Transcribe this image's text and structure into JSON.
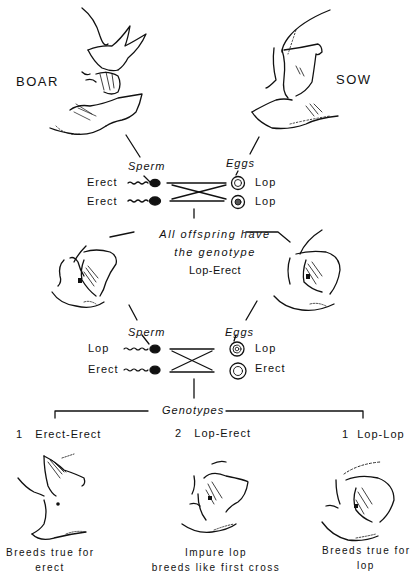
{
  "parents": {
    "boar_label": "BOAR",
    "sow_label": "SOW"
  },
  "cross1": {
    "sperm_heading": "Sperm",
    "eggs_heading": "Eggs",
    "sperm": [
      {
        "allele": "Erect"
      },
      {
        "allele": "Erect"
      }
    ],
    "eggs": [
      {
        "allele": "Lop"
      },
      {
        "allele": "Lop"
      }
    ],
    "result_line1": "All offspring have",
    "result_line2": "the genotype",
    "result_genotype": "Lop-Erect"
  },
  "cross2": {
    "sperm_heading": "Sperm",
    "eggs_heading": "Eggs",
    "sperm": [
      {
        "allele": "Lop"
      },
      {
        "allele": "Erect"
      }
    ],
    "eggs": [
      {
        "allele": "Lop"
      },
      {
        "allele": "Erect"
      }
    ],
    "genotypes_heading": "Genotypes"
  },
  "outcomes": [
    {
      "ratio": "1",
      "genotype": "Erect-Erect",
      "caption_line1": "Breeds true for",
      "caption_line2": "erect"
    },
    {
      "ratio": "2",
      "genotype": "Lop-Erect",
      "caption_line1": "Impure lop",
      "caption_line2": "breeds like first cross"
    },
    {
      "ratio": "1",
      "genotype": "Lop-Lop",
      "caption_line1": "Breeds true for",
      "caption_line2": "lop"
    }
  ],
  "colors": {
    "ink": "#111111",
    "background": "#ffffff"
  }
}
